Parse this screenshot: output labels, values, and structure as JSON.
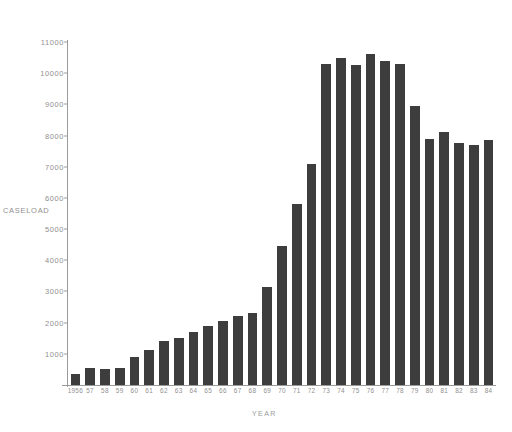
{
  "chart_data": {
    "type": "bar",
    "title": "",
    "xlabel": "YEAR",
    "ylabel": "CASELOAD",
    "ylim": [
      0,
      11000
    ],
    "ytick_labels": [
      "11000",
      "10000",
      "9000",
      "8000",
      "7000",
      "6000",
      "5000",
      "4000",
      "3000",
      "2000",
      "1000"
    ],
    "ytick_values": [
      11000,
      10000,
      9000,
      8000,
      7000,
      6000,
      5000,
      4000,
      3000,
      2000,
      1000
    ],
    "grid": false,
    "legend": "none",
    "bar_color": "#3d3d3d",
    "axis_color": "#9b9b9b",
    "text_color": "#8f8f8f",
    "categories": [
      "1956",
      "57",
      "58",
      "59",
      "60",
      "61",
      "62",
      "63",
      "64",
      "65",
      "66",
      "67",
      "68",
      "69",
      "70",
      "71",
      "72",
      "73",
      "74",
      "75",
      "76",
      "77",
      "78",
      "79",
      "80",
      "81",
      "82",
      "83",
      "84"
    ],
    "values": [
      350,
      560,
      500,
      560,
      900,
      1130,
      1400,
      1500,
      1700,
      1900,
      2050,
      2200,
      2300,
      3150,
      4450,
      5800,
      7100,
      10300,
      10500,
      10250,
      10600,
      10400,
      10300,
      8950,
      7900,
      8100,
      7750,
      7700,
      7850
    ]
  },
  "axis_titles": {
    "y": "CASELOAD",
    "x": "YEAR"
  }
}
